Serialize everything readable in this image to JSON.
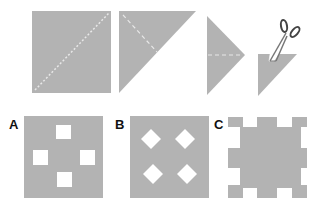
{
  "diagram": {
    "colors": {
      "paper": "#b3b3b3",
      "fold": "#e8e8e8",
      "background": "#ffffff",
      "scissors": "#555555"
    },
    "steps": [
      {
        "id": "step-1",
        "shape": "square",
        "fold": "diagonal"
      },
      {
        "id": "step-2",
        "shape": "triangle",
        "fold": "half"
      },
      {
        "id": "step-3",
        "shape": "triangle",
        "fold": "horizontal"
      },
      {
        "id": "step-4",
        "shape": "small-triangle",
        "action": "cut-corner",
        "icon": "scissors-icon"
      }
    ],
    "options": [
      {
        "label": "A",
        "pattern": "four square holes in cross arrangement"
      },
      {
        "label": "B",
        "pattern": "four diamond holes in grid"
      },
      {
        "label": "C",
        "pattern": "notched edges"
      }
    ]
  }
}
